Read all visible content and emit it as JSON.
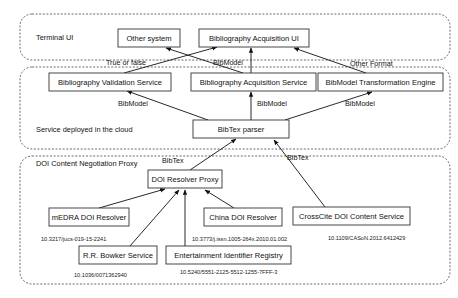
{
  "regions": [
    {
      "id": "terminal",
      "label": "Terminal UI",
      "x": 20,
      "y": 14,
      "w": 430,
      "h": 46,
      "lx": 36,
      "ly": 40
    },
    {
      "id": "cloud",
      "label": "Service deployed in the cloud",
      "x": 20,
      "y": 67,
      "w": 430,
      "h": 82,
      "lx": 36,
      "ly": 132
    },
    {
      "id": "doi",
      "label": "DOI Content Negotiation Proxy",
      "x": 20,
      "y": 156,
      "w": 430,
      "h": 128,
      "lx": 36,
      "ly": 166
    }
  ],
  "nodes": [
    {
      "id": "other-system",
      "label": "Other system",
      "x": 118,
      "y": 29,
      "w": 62,
      "h": 18
    },
    {
      "id": "bib-acq-ui",
      "label": "Bibliography Acquisition UI",
      "x": 199,
      "y": 29,
      "w": 110,
      "h": 18
    },
    {
      "id": "bib-val",
      "label": "Bibliography Validation Service",
      "x": 49,
      "y": 73,
      "w": 122,
      "h": 18
    },
    {
      "id": "bib-acq-svc",
      "label": "Bibliography Acquisition Service",
      "x": 191,
      "y": 73,
      "w": 125,
      "h": 18
    },
    {
      "id": "bibmodel-engine",
      "label": "BibModel Transformation Engine",
      "x": 318,
      "y": 73,
      "w": 125,
      "h": 18
    },
    {
      "id": "bibtex-parser",
      "label": "BibTex parser",
      "x": 193,
      "y": 120,
      "w": 96,
      "h": 18
    },
    {
      "id": "doi-proxy",
      "label": "DOI Resolver Proxy",
      "x": 148,
      "y": 170,
      "w": 74,
      "h": 18
    },
    {
      "id": "medra",
      "label": "mEDRA DOI Resolver",
      "x": 49,
      "y": 208,
      "w": 80,
      "h": 18
    },
    {
      "id": "china",
      "label": "China DOI Resolver",
      "x": 204,
      "y": 208,
      "w": 78,
      "h": 18
    },
    {
      "id": "crosscite",
      "label": "CrossCite DOI Content Service",
      "x": 293,
      "y": 207,
      "w": 117,
      "h": 18
    },
    {
      "id": "bowker",
      "label": "R.R. Bowker Service",
      "x": 79,
      "y": 246,
      "w": 78,
      "h": 18
    },
    {
      "id": "eidr",
      "label": "Entertainment Identifier Registry",
      "x": 166,
      "y": 246,
      "w": 125,
      "h": 18
    }
  ],
  "edges": [
    {
      "from": "bib-val",
      "x1": 124,
      "y1": 73,
      "x2": 217,
      "y2": 47
    },
    {
      "from": "bib-acq-svc",
      "x1": 243,
      "y1": 73,
      "x2": 166,
      "y2": 48
    },
    {
      "from": "bib-acq-svc",
      "x1": 251,
      "y1": 73,
      "x2": 251,
      "y2": 48
    },
    {
      "from": "bibmodel-engine",
      "x1": 366,
      "y1": 73,
      "x2": 294,
      "y2": 48
    },
    {
      "from": "bibtex-parser",
      "x1": 208,
      "y1": 120,
      "x2": 127,
      "y2": 91
    },
    {
      "from": "bibtex-parser",
      "x1": 251,
      "y1": 120,
      "x2": 251,
      "y2": 92
    },
    {
      "from": "bibtex-parser",
      "x1": 285,
      "y1": 120,
      "x2": 372,
      "y2": 92
    },
    {
      "from": "doi-proxy",
      "x1": 190,
      "y1": 170,
      "x2": 236,
      "y2": 139
    },
    {
      "from": "crosscite",
      "x1": 325,
      "y1": 207,
      "x2": 274,
      "y2": 140
    },
    {
      "from": "medra",
      "x1": 99,
      "y1": 208,
      "x2": 165,
      "y2": 189
    },
    {
      "from": "bowker",
      "x1": 130,
      "y1": 246,
      "x2": 179,
      "y2": 190
    },
    {
      "from": "eidr",
      "x1": 185,
      "y1": 246,
      "x2": 185,
      "y2": 190
    },
    {
      "from": "china",
      "x1": 234,
      "y1": 208,
      "x2": 205,
      "y2": 190
    },
    {
      "from": "other-to-up",
      "x1": 166,
      "y1": 73,
      "x2": 166,
      "y2": 48
    }
  ],
  "edge_labels": [
    {
      "text": "True or false",
      "x": 106,
      "y": 65
    },
    {
      "text": "BibModel",
      "x": 213,
      "y": 65
    },
    {
      "text": "Other Format",
      "x": 350,
      "y": 66
    },
    {
      "text": "BibModel",
      "x": 118,
      "y": 106
    },
    {
      "text": "BibModel",
      "x": 257,
      "y": 106
    },
    {
      "text": "BibModel",
      "x": 345,
      "y": 106
    },
    {
      "text": "BibTex",
      "x": 162,
      "y": 163
    },
    {
      "text": "BibTex",
      "x": 287,
      "y": 160
    }
  ],
  "doi_labels": [
    {
      "text": "10.3217/jucs-019-15-2241",
      "x": 41,
      "y": 241
    },
    {
      "text": "10.3773/j.issn.1005-264x.2010.01.002",
      "x": 192,
      "y": 241
    },
    {
      "text": "10.1109/CASoN.2012.6412429",
      "x": 328,
      "y": 240
    },
    {
      "text": "10.1036/0071362940",
      "x": 74,
      "y": 277
    },
    {
      "text": "10.5240/5551-2125-5512-1255-7FFF-3",
      "x": 180,
      "y": 274
    }
  ]
}
